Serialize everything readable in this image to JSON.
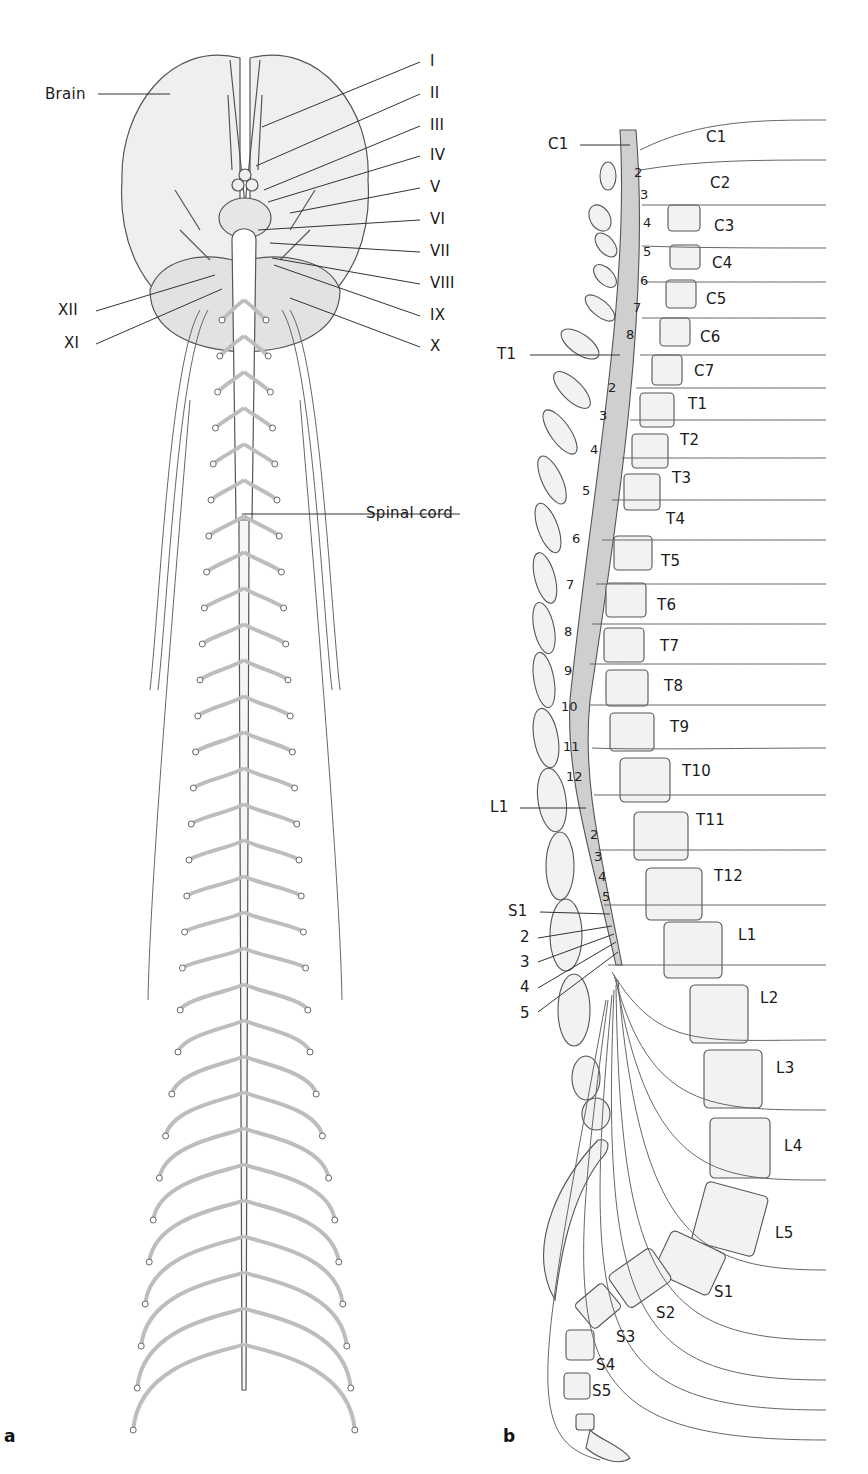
{
  "panel_a": {
    "panel_letter": "a",
    "brain_label": "Brain",
    "spinal_cord_label": "Spinal cord",
    "cranial_nerves_right": [
      "I",
      "II",
      "III",
      "IV",
      "V",
      "VI",
      "VII",
      "VIII",
      "IX",
      "X"
    ],
    "cranial_nerves_left": [
      "XII",
      "XI"
    ]
  },
  "panel_b": {
    "panel_letter": "b",
    "cord_callouts": [
      "C1",
      "T1",
      "L1",
      "S1",
      "2",
      "3",
      "4",
      "5"
    ],
    "cord_segment_numbers": {
      "cervical": [
        "2",
        "3",
        "4",
        "5",
        "6",
        "7",
        "8"
      ],
      "thoracic": [
        "2",
        "3",
        "4",
        "5",
        "6",
        "7",
        "8",
        "9",
        "10",
        "11",
        "12"
      ],
      "lumbar": [
        "2",
        "3",
        "4",
        "5"
      ]
    },
    "vertebra_labels": [
      "C1",
      "C2",
      "C3",
      "C4",
      "C5",
      "C6",
      "C7",
      "T1",
      "T2",
      "T3",
      "T4",
      "T5",
      "T6",
      "T7",
      "T8",
      "T9",
      "T10",
      "T11",
      "T12",
      "L1",
      "L2",
      "L3",
      "L4",
      "L5",
      "S1",
      "S2",
      "S3",
      "S4",
      "S5"
    ]
  },
  "colors": {
    "line": "#555555",
    "fill_light": "#ececec",
    "cord_fill": "#c9c9c9",
    "text": "#1a1a1a"
  }
}
